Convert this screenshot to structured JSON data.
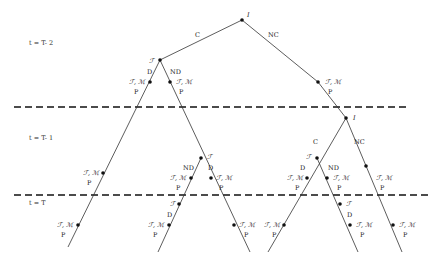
{
  "diagram": {
    "periods": [
      {
        "label": "t = T- 2"
      },
      {
        "label": "t = T- 1"
      },
      {
        "label": "t = T"
      }
    ],
    "node_labels": {
      "root": "I",
      "second_I": "I",
      "F": "ℱ",
      "FM": "ℱ, ℳ",
      "P": "P"
    },
    "edge_labels": {
      "C": "C",
      "NC": "NC",
      "D": "D",
      "ND": "ND"
    },
    "colors": {
      "line": "#333333",
      "dash": "#111111",
      "node": "#111111",
      "text": "#222222"
    }
  }
}
